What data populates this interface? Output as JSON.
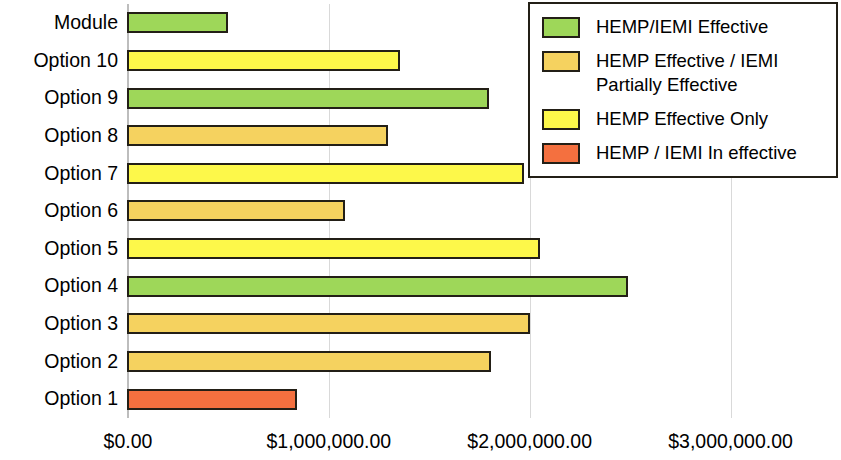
{
  "chart_data": {
    "type": "bar",
    "orientation": "horizontal",
    "title": "",
    "xlabel": "",
    "ylabel": "",
    "xlim": [
      0,
      3500000
    ],
    "grid": true,
    "xticks": [
      {
        "value": 0,
        "label": "$0.00"
      },
      {
        "value": 1000000,
        "label": "$1,000,000.00"
      },
      {
        "value": 2000000,
        "label": "$2,000,000.00"
      },
      {
        "value": 3000000,
        "label": "$3,000,000.00"
      }
    ],
    "categories": [
      "Module",
      "Option 10",
      "Option 9",
      "Option 8",
      "Option 7",
      "Option 6",
      "Option 5",
      "Option 4",
      "Option 3",
      "Option 2",
      "Option 1"
    ],
    "values": [
      500000,
      1355000,
      1795000,
      1295000,
      1970000,
      1080000,
      2050000,
      2490000,
      2000000,
      1805000,
      840000
    ],
    "bar_categories": [
      "HEMP/IEMI Effective",
      "HEMP Effective Only",
      "HEMP/IEMI Effective",
      "HEMP Effective / IEMI Partially Effective",
      "HEMP Effective Only",
      "HEMP Effective / IEMI Partially Effective",
      "HEMP Effective Only",
      "HEMP/IEMI Effective",
      "HEMP Effective / IEMI Partially Effective",
      "HEMP Effective / IEMI Partially Effective",
      "HEMP / IEMI In effective"
    ],
    "bar_colors": [
      "#9ed759",
      "#fdf84a",
      "#9ed759",
      "#f5d25f",
      "#fdf84a",
      "#f5d25f",
      "#fdf84a",
      "#9ed759",
      "#f5d25f",
      "#f5d25f",
      "#f4703f"
    ],
    "legend": {
      "position": "top-right",
      "entries": [
        {
          "label": "HEMP/IEMI Effective",
          "color": "#9ed759"
        },
        {
          "label": "HEMP Effective / IEMI\nPartially Effective",
          "color": "#f5d25f"
        },
        {
          "label": "HEMP Effective Only",
          "color": "#fdf84a"
        },
        {
          "label": "HEMP / IEMI In effective",
          "color": "#f4703f"
        }
      ]
    },
    "colors": {
      "border": "#231f16",
      "gridline": "#d9d9d9",
      "axis": "#bdbdbd",
      "background": "#ffffff",
      "text": "#000000"
    }
  }
}
